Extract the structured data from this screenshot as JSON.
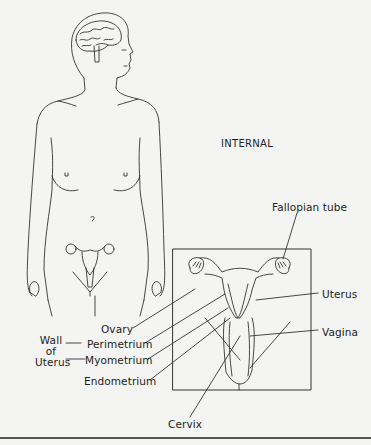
{
  "diagram": {
    "section_label": "INTERNAL",
    "labels": {
      "fallopian_tube": "Fallopian tube",
      "uterus": "Uterus",
      "vagina": "Vagina",
      "ovary": "Ovary",
      "perimetrium": "Perimetrium",
      "myometrium": "Myometrium",
      "endometrium": "Endometrium",
      "cervix": "Cervix",
      "wall_of_uterus_line1": "Wall",
      "wall_of_uterus_line2": "of",
      "wall_of_uterus_line3": "Uterus"
    },
    "colors": {
      "background": "#f4f4f2",
      "line": "#333333"
    }
  }
}
